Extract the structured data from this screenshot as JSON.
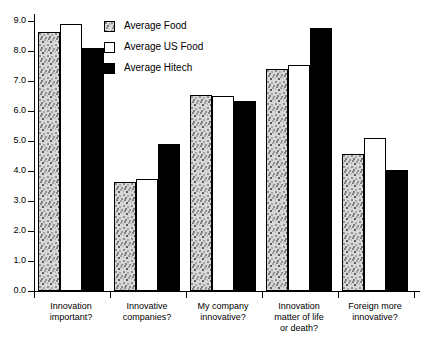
{
  "chart_data": {
    "type": "bar",
    "title": "",
    "subtitle": "",
    "xlabel": "",
    "ylabel": "",
    "ylim": [
      0.0,
      9.0
    ],
    "ytick_labels": [
      "0.0",
      "1.0",
      "2.0",
      "3.0",
      "4.0",
      "5.0",
      "6.0",
      "7.0",
      "8.0",
      "9.0"
    ],
    "ytick_values": [
      0.0,
      1.0,
      2.0,
      3.0,
      4.0,
      5.0,
      6.0,
      7.0,
      8.0,
      9.0
    ],
    "grid": false,
    "legend_position": "top-center",
    "categories": [
      "Innovation important?",
      "Innovative companies?",
      "My company innovative?",
      "Innovation matter of life or death?",
      "Foreign more innovative?"
    ],
    "category_lines": [
      [
        "Innovation",
        "important?"
      ],
      [
        "Innovative",
        "companies?"
      ],
      [
        "My company",
        "innovative?"
      ],
      [
        "Innovation",
        "matter of life",
        "or death?"
      ],
      [
        "Foreign more",
        "innovative?"
      ]
    ],
    "series": [
      {
        "name": "Average Food",
        "style": "stippled-gray",
        "color": "#d8d8d8",
        "values": [
          8.65,
          3.65,
          6.55,
          7.4,
          4.58
        ]
      },
      {
        "name": "Average US Food",
        "style": "white",
        "color": "#ffffff",
        "values": [
          8.9,
          3.72,
          6.5,
          7.52,
          5.1
        ]
      },
      {
        "name": "Average Hitech",
        "style": "black",
        "color": "#000000",
        "values": [
          8.1,
          4.9,
          6.35,
          8.78,
          4.05
        ]
      }
    ]
  },
  "legend": {
    "items": [
      {
        "label": "Average Food",
        "swatch": "gray"
      },
      {
        "label": "Average US Food",
        "swatch": "white"
      },
      {
        "label": "Average Hitech",
        "swatch": "black"
      }
    ]
  },
  "axis": {
    "y_labels": [
      "9.0",
      "8.0",
      "7.0",
      "6.0",
      "5.0",
      "4.0",
      "3.0",
      "2.0",
      "1.0",
      "0.0"
    ]
  }
}
